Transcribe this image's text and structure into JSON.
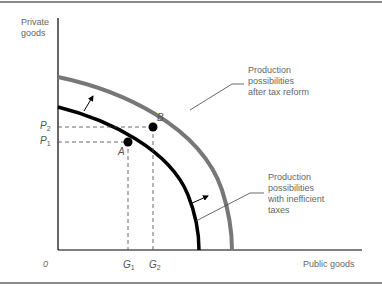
{
  "diagram": {
    "type": "production-possibilities-frontier",
    "y_axis_label": [
      "Private",
      "goods"
    ],
    "x_axis_label": "Public goods",
    "origin_label": "0",
    "curves": [
      {
        "name": "inner",
        "label_lines": [
          "Production",
          "possibilities",
          "with inefficient",
          "taxes"
        ],
        "color": "#000000"
      },
      {
        "name": "outer",
        "label_lines": [
          "Production",
          "possibilities",
          "after tax reform"
        ],
        "color": "#777777"
      }
    ],
    "points": [
      {
        "name": "A",
        "label": "A"
      },
      {
        "name": "B",
        "label": "B"
      }
    ],
    "y_ticks": [
      {
        "base": "P",
        "sub": "2"
      },
      {
        "base": "P",
        "sub": "1"
      }
    ],
    "x_ticks": [
      {
        "base": "G",
        "sub": "1"
      },
      {
        "base": "G",
        "sub": "2"
      }
    ]
  }
}
